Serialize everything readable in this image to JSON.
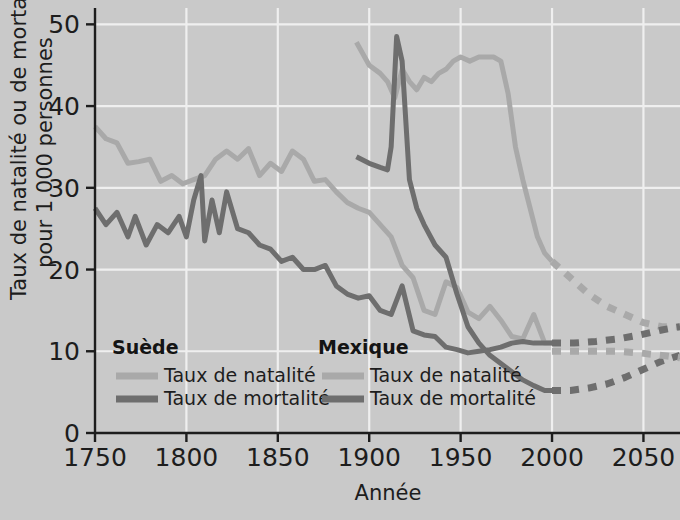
{
  "chart_data": {
    "type": "line",
    "title": "",
    "xlabel": "Année",
    "ylabel": "Taux de natalité ou de mortalité pour 1 000 personnes",
    "ylabel_line1": "Taux de natalité ou de mortalité",
    "ylabel_line2": "pour 1 000 personnes",
    "xlim": [
      1750,
      2070
    ],
    "ylim": [
      0,
      52
    ],
    "xticks": [
      "1750",
      "1800",
      "1850",
      "1900",
      "1950",
      "2000",
      "2050"
    ],
    "xtick_values": [
      1750,
      1800,
      1850,
      1900,
      1950,
      2000,
      2050
    ],
    "yticks": [
      "0",
      "10",
      "20",
      "30",
      "40",
      "50"
    ],
    "ytick_values": [
      0,
      10,
      20,
      30,
      40,
      50
    ],
    "grid": true,
    "grid_color": "#efefef",
    "plot_background": "#c9c9c9",
    "legend_position": "inside-bottom-left",
    "colors": {
      "birth_rate": "#a9a9a9",
      "death_rate": "#6e6e6e",
      "text": "#1d1d1d",
      "background": "#c9c9c9",
      "gridline": "#efefef"
    },
    "series": [
      {
        "name": "Suède — Taux de natalité",
        "country": "Suède",
        "measure": "Taux de natalité",
        "color": "#a9a9a9",
        "style": "solid",
        "x": [
          1750,
          1756,
          1762,
          1768,
          1774,
          1780,
          1786,
          1792,
          1798,
          1804,
          1810,
          1816,
          1822,
          1828,
          1834,
          1840,
          1846,
          1852,
          1858,
          1864,
          1870,
          1876,
          1882,
          1888,
          1894,
          1900,
          1906,
          1912,
          1918,
          1924,
          1930,
          1936,
          1942,
          1948,
          1954,
          1960,
          1966,
          1972,
          1978,
          1984,
          1990,
          1996,
          2000
        ],
        "y": [
          37.5,
          36.0,
          35.5,
          33.0,
          33.2,
          33.5,
          30.8,
          31.5,
          30.5,
          31.0,
          31.5,
          33.5,
          34.5,
          33.5,
          34.8,
          31.5,
          33.0,
          32.0,
          34.5,
          33.5,
          30.8,
          31.0,
          29.5,
          28.2,
          27.5,
          27.0,
          25.5,
          24.0,
          20.5,
          19.0,
          15.0,
          14.5,
          18.5,
          17.8,
          14.8,
          14.0,
          15.5,
          13.8,
          11.8,
          11.5,
          14.5,
          11.0,
          11.0
        ]
      },
      {
        "name": "Suède — Taux de mortalité",
        "country": "Suède",
        "measure": "Taux de mortalité",
        "color": "#6e6e6e",
        "style": "solid",
        "x": [
          1750,
          1756,
          1762,
          1768,
          1772,
          1778,
          1784,
          1790,
          1796,
          1800,
          1804,
          1808,
          1810,
          1814,
          1818,
          1822,
          1828,
          1834,
          1840,
          1846,
          1852,
          1858,
          1864,
          1870,
          1876,
          1882,
          1888,
          1894,
          1900,
          1906,
          1912,
          1918,
          1924,
          1930,
          1936,
          1942,
          1948,
          1954,
          1960,
          1966,
          1972,
          1978,
          1984,
          1990,
          1996,
          2000
        ],
        "y": [
          27.5,
          25.5,
          27.0,
          24.0,
          26.5,
          23.0,
          25.5,
          24.5,
          26.5,
          24.0,
          28.5,
          31.5,
          23.5,
          28.5,
          24.5,
          29.5,
          25.0,
          24.5,
          23.0,
          22.5,
          21.0,
          21.5,
          20.0,
          20.0,
          20.5,
          18.0,
          17.0,
          16.5,
          16.8,
          15.0,
          14.5,
          18.0,
          12.5,
          12.0,
          11.8,
          10.5,
          10.2,
          9.8,
          10.0,
          10.2,
          10.5,
          11.0,
          11.2,
          11.0,
          11.0,
          11.0
        ]
      },
      {
        "name": "Mexique — Taux de natalité",
        "country": "Mexique",
        "measure": "Taux de natalité",
        "color": "#a9a9a9",
        "style": "solid",
        "x": [
          1893,
          1900,
          1906,
          1910,
          1914,
          1918,
          1922,
          1926,
          1930,
          1934,
          1938,
          1942,
          1946,
          1950,
          1955,
          1960,
          1964,
          1968,
          1972,
          1976,
          1980,
          1984,
          1988,
          1992,
          1996,
          2000
        ],
        "y": [
          47.8,
          45.0,
          44.0,
          43.0,
          41.0,
          44.5,
          43.0,
          42.0,
          43.5,
          43.0,
          44.0,
          44.5,
          45.5,
          46.0,
          45.5,
          46.0,
          46.0,
          46.0,
          45.5,
          41.5,
          35.0,
          31.0,
          27.5,
          24.0,
          22.0,
          21.0
        ]
      },
      {
        "name": "Mexique — Taux de mortalité",
        "country": "Mexique",
        "measure": "Taux de mortalité",
        "color": "#6e6e6e",
        "style": "solid",
        "x": [
          1893,
          1900,
          1906,
          1910,
          1912,
          1915,
          1918,
          1922,
          1926,
          1930,
          1936,
          1942,
          1948,
          1954,
          1960,
          1966,
          1972,
          1978,
          1984,
          1990,
          1996,
          2000
        ],
        "y": [
          33.8,
          33.0,
          32.5,
          32.2,
          35.0,
          48.5,
          45.5,
          31.0,
          27.5,
          25.5,
          23.0,
          21.5,
          17.0,
          13.0,
          11.0,
          9.5,
          8.5,
          7.5,
          6.5,
          5.8,
          5.2,
          5.2
        ]
      }
    ],
    "projections": [
      {
        "name": "Mexique — Taux de natalité (projection)",
        "country": "Mexique",
        "measure": "Taux de natalité",
        "color": "#a9a9a9",
        "style": "dashed",
        "x": [
          2000,
          2010,
          2020,
          2030,
          2040,
          2050,
          2060,
          2070
        ],
        "y": [
          21.0,
          19.0,
          17.0,
          15.5,
          14.5,
          13.5,
          13.0,
          13.0
        ]
      },
      {
        "name": "Mexique — Taux de mortalité (projection)",
        "country": "Mexique",
        "measure": "Taux de mortalité",
        "color": "#6e6e6e",
        "style": "dashed",
        "x": [
          2000,
          2010,
          2020,
          2030,
          2040,
          2050,
          2060,
          2070
        ],
        "y": [
          5.2,
          5.2,
          5.5,
          6.0,
          6.8,
          7.8,
          8.8,
          9.5
        ]
      },
      {
        "name": "Suède — Taux de mortalité (projection)",
        "country": "Suède",
        "measure": "Taux de mortalité",
        "color": "#6e6e6e",
        "style": "dashed",
        "x": [
          2000,
          2012,
          2024,
          2036,
          2048,
          2060,
          2070
        ],
        "y": [
          11.0,
          11.0,
          11.2,
          11.5,
          12.0,
          12.6,
          13.0
        ]
      },
      {
        "name": "Suède — Taux de natalité (projection)",
        "country": "Suède",
        "measure": "Taux de natalité",
        "color": "#a9a9a9",
        "style": "dashed",
        "x": [
          2000,
          2012,
          2024,
          2036,
          2048,
          2060,
          2070
        ],
        "y": [
          10.0,
          10.0,
          10.0,
          10.0,
          9.8,
          9.5,
          9.2
        ]
      }
    ],
    "annotations": []
  },
  "legend": {
    "groups": [
      {
        "heading": "Suède",
        "entries": [
          {
            "label": "Taux de natalité",
            "color": "#a9a9a9"
          },
          {
            "label": "Taux de mortalité",
            "color": "#6e6e6e"
          }
        ]
      },
      {
        "heading": "Mexique",
        "entries": [
          {
            "label": "Taux de natalité",
            "color": "#a9a9a9"
          },
          {
            "label": "Taux de mortalité",
            "color": "#6e6e6e"
          }
        ]
      }
    ]
  }
}
